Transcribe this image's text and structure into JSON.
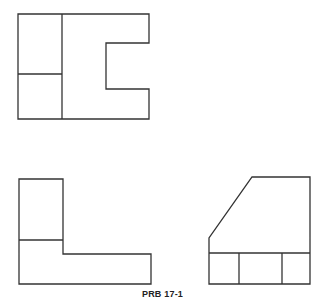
{
  "figure": {
    "caption": "PRB 17-1",
    "stroke_color": "#333333",
    "background": "#ffffff"
  },
  "views": [
    {
      "name": "top-view",
      "description": "Rectangle with left column split horizontally and a rectangular notch on right side"
    },
    {
      "name": "front-view",
      "description": "L-shaped profile with tall left column split horizontally"
    },
    {
      "name": "right-side-view",
      "description": "Profile with chamfered upper-left corner and lower band split into three cells"
    }
  ]
}
